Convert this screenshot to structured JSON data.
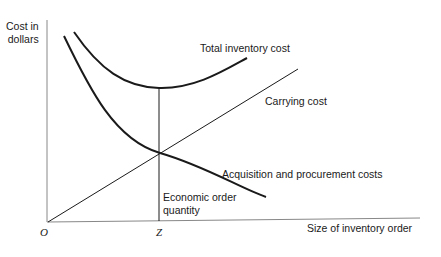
{
  "diagram": {
    "title": "Economic order quantity",
    "y_axis_label_line1": "Cost in",
    "y_axis_label_line2": "dollars",
    "x_axis_label": "Size of inventory order",
    "origin_label": "O",
    "z_label": "Z",
    "eoq_label_line1": "Economic order",
    "eoq_label_line2": "quantity",
    "curves": {
      "total": "Total inventory cost",
      "carrying": "Carrying cost",
      "acquisition": "Acquisition and procurement costs"
    },
    "colors": {
      "line": "#1a1a1a",
      "background": "#ffffff"
    }
  }
}
